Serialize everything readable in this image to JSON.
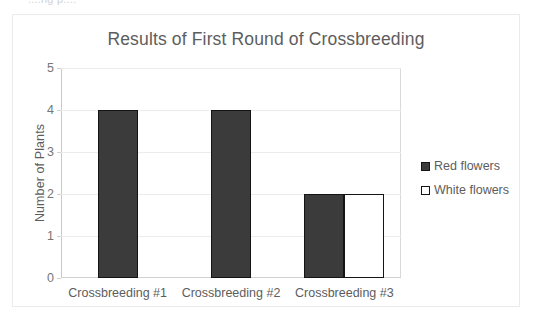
{
  "top_sliver_text": "....ng p....",
  "chart_data": {
    "type": "bar",
    "title": "Results of First Round of Crossbreeding",
    "xlabel": "",
    "ylabel": "Number of Plants",
    "categories": [
      "Crossbreeding #1",
      "Crossbreeding #2",
      "Crossbreeding #3"
    ],
    "series": [
      {
        "name": "Red flowers",
        "values": [
          4,
          4,
          2
        ],
        "color": "#3b3b3b"
      },
      {
        "name": "White flowers",
        "values": [
          0,
          0,
          2
        ],
        "color": "#ffffff"
      }
    ],
    "ylim": [
      0,
      5
    ],
    "yticks": [
      0,
      1,
      2,
      3,
      4,
      5
    ],
    "ytick_labels": [
      "0",
      "1",
      "2",
      "3",
      "4",
      "5"
    ],
    "grid": true,
    "legend_position": "right"
  },
  "legend": {
    "items": [
      {
        "label": "Red flowers",
        "swatch": "red"
      },
      {
        "label": "White flowers",
        "swatch": "white"
      }
    ]
  },
  "colors": {
    "bar_fill": "#3b3b3b",
    "bar_outline": "#141414",
    "title_text": "#5d5d5d",
    "axis_text": "#767676",
    "gridline": "#ececec",
    "frame_border": "#ebebeb"
  }
}
